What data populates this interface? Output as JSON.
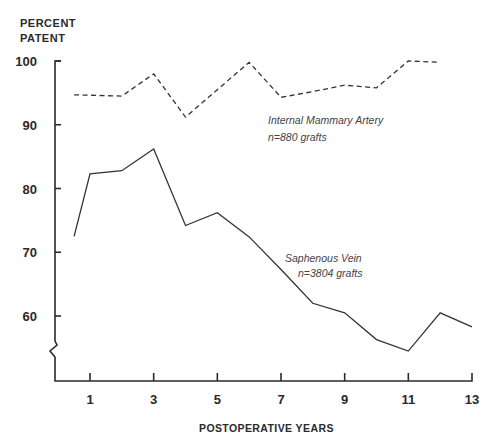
{
  "chart_data": {
    "type": "line",
    "title": "",
    "xlabel": "POSTOPERATIVE YEARS",
    "ylabel_lines": [
      "PERCENT",
      "PATENT"
    ],
    "ylabel": "PERCENT PATENT",
    "xlim": [
      0,
      13
    ],
    "ylim": [
      50,
      100
    ],
    "x_ticks": [
      1,
      3,
      5,
      7,
      9,
      11,
      13
    ],
    "y_ticks": [
      60,
      70,
      80,
      90,
      100
    ],
    "axis_break": true,
    "grid": false,
    "series": [
      {
        "name": "Internal Mammary Artery",
        "annotation": [
          "Internal Mammary Artery",
          "n=880 grafts"
        ],
        "style": "dashed",
        "x": [
          0.5,
          2,
          3,
          4,
          5,
          6,
          7,
          8,
          9,
          10,
          11,
          12
        ],
        "values": [
          94.7,
          94.5,
          98.0,
          91.2,
          95.5,
          99.8,
          94.3,
          95.2,
          96.2,
          95.8,
          100.0,
          99.8
        ]
      },
      {
        "name": "Saphenous Vein",
        "annotation": [
          "Saphenous Vein",
          "n=3804 grafts"
        ],
        "style": "solid",
        "x": [
          0.5,
          1,
          2,
          3,
          4,
          5,
          6,
          7,
          8,
          9,
          10,
          11,
          12,
          13
        ],
        "values": [
          72.5,
          82.3,
          82.8,
          86.2,
          74.2,
          76.2,
          72.4,
          67.3,
          62.0,
          60.5,
          56.3,
          54.5,
          60.5,
          58.3
        ]
      }
    ]
  }
}
